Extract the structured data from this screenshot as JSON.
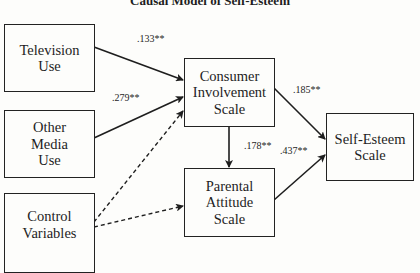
{
  "title": "Causal Model of Self-Esteem",
  "nodes": {
    "tv": {
      "lines": [
        "Television",
        "Use"
      ]
    },
    "media": {
      "lines": [
        "Other",
        "Media",
        "Use"
      ]
    },
    "control": {
      "lines": [
        "Control",
        "Variables"
      ]
    },
    "consumer": {
      "lines": [
        "Consumer",
        "Involvement",
        "Scale"
      ]
    },
    "parental": {
      "lines": [
        "Parental",
        "Attitude",
        "Scale"
      ]
    },
    "esteem": {
      "lines": [
        "Self-Esteem",
        "Scale"
      ]
    }
  },
  "edges": {
    "tv_consumer": {
      "label": ".133**",
      "style": "solid"
    },
    "media_consumer": {
      "label": ".279**",
      "style": "solid"
    },
    "control_consumer": {
      "label": "",
      "style": "dashed"
    },
    "control_parental": {
      "label": "",
      "style": "dashed"
    },
    "consumer_esteem": {
      "label": ".185**",
      "style": "solid"
    },
    "consumer_parental": {
      "label": ".178**",
      "style": "solid"
    },
    "parental_esteem": {
      "label": ".437**",
      "style": "solid"
    }
  }
}
